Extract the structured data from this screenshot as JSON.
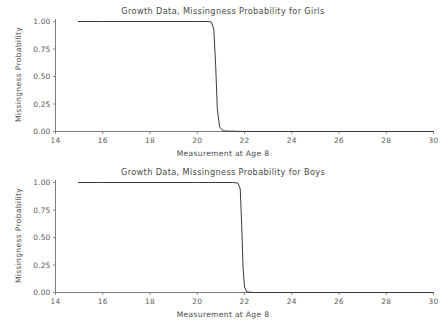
{
  "figure": {
    "background": "#ffffff",
    "line_color": "#3a3a3a",
    "axis_color": "#6e6e6e",
    "text_color": "#4a4a4a"
  },
  "charts": [
    {
      "id": "girls",
      "title": "Growth Data, Missingness Probability for Girls",
      "xlabel": "Measurement at Age 8",
      "ylabel": "Missingness Probability",
      "xticks": [
        14,
        16,
        18,
        20,
        22,
        24,
        26,
        28,
        30
      ],
      "xtick_labels": [
        "14",
        "16",
        "18",
        "20",
        "22",
        "24",
        "26",
        "28",
        "30"
      ],
      "yticks": [
        0.0,
        0.25,
        0.5,
        0.75,
        1.0
      ],
      "ytick_labels": [
        "0.00",
        "0.25",
        "0.50",
        "0.75",
        "1.00"
      ],
      "xlim": [
        14,
        30
      ],
      "ylim": [
        0.0,
        1.0
      ],
      "grid": false,
      "legend": null
    },
    {
      "id": "boys",
      "title": "Growth Data, Missingness Probability for Boys",
      "xlabel": "Measurement at Age 8",
      "ylabel": "Missingness Probability",
      "xticks": [
        14,
        16,
        18,
        20,
        22,
        24,
        26,
        28,
        30
      ],
      "xtick_labels": [
        "14",
        "16",
        "18",
        "20",
        "22",
        "24",
        "26",
        "28",
        "30"
      ],
      "yticks": [
        0.0,
        0.25,
        0.5,
        0.75,
        1.0
      ],
      "ytick_labels": [
        "0.00",
        "0.25",
        "0.50",
        "0.75",
        "1.00"
      ],
      "xlim": [
        14,
        30
      ],
      "ylim": [
        0.0,
        1.0
      ],
      "grid": false,
      "legend": null
    }
  ],
  "chart_data": [
    {
      "type": "line",
      "title": "Growth Data, Missingness Probability for Girls",
      "xlabel": "Measurement at Age 8",
      "ylabel": "Missingness Probability",
      "xlim": [
        14,
        30
      ],
      "ylim": [
        0.0,
        1.0
      ],
      "grid": false,
      "legend": null,
      "series": [
        {
          "name": "Missingness Probability (Girls)",
          "x": [
            14.95,
            16.0,
            18.0,
            20.0,
            20.45,
            20.6,
            20.7,
            20.78,
            20.85,
            20.95,
            21.1,
            22.0,
            24.0,
            26.0,
            28.0,
            30.0
          ],
          "y": [
            1.0,
            1.0,
            1.0,
            1.0,
            1.0,
            0.995,
            0.93,
            0.6,
            0.2,
            0.04,
            0.005,
            0.0,
            0.0,
            0.0,
            0.0,
            0.0
          ]
        }
      ]
    },
    {
      "type": "line",
      "title": "Growth Data, Missingness Probability for Boys",
      "xlabel": "Measurement at Age 8",
      "ylabel": "Missingness Probability",
      "xlim": [
        14,
        30
      ],
      "ylim": [
        0.0,
        1.0
      ],
      "grid": false,
      "legend": null,
      "series": [
        {
          "name": "Missingness Probability (Boys)",
          "x": [
            14.95,
            16.0,
            18.0,
            20.0,
            21.5,
            21.72,
            21.82,
            21.88,
            21.94,
            22.0,
            22.1,
            22.4,
            24.0,
            26.0,
            28.0,
            30.0
          ],
          "y": [
            1.0,
            1.0,
            1.0,
            1.0,
            1.0,
            0.995,
            0.94,
            0.62,
            0.22,
            0.05,
            0.005,
            0.0,
            0.0,
            0.0,
            0.0,
            0.0
          ]
        }
      ]
    }
  ]
}
